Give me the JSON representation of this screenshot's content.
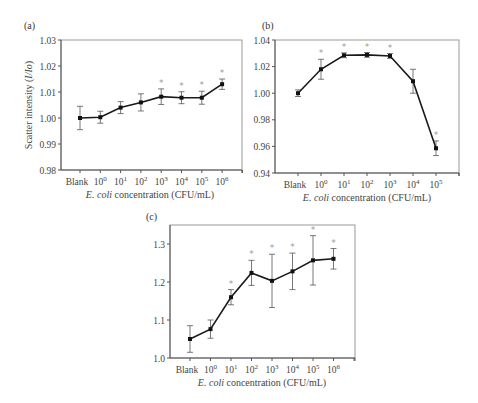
{
  "chart_data": [
    {
      "panel": "(a)",
      "type": "line",
      "title": "",
      "xlabel": "E. coli concentration (CFU/mL)",
      "xlabel_italic": "E. coli",
      "xlabel_rest": " concentration (CFU/mL)",
      "ylabel": "Scatter intensity (I/Io)",
      "categories": [
        "Blank",
        "10^0",
        "10^1",
        "10^2",
        "10^3",
        "10^4",
        "10^5",
        "10^6"
      ],
      "values": [
        1.0,
        1.0003,
        1.004,
        1.006,
        1.0082,
        1.0078,
        1.0078,
        1.013
      ],
      "errors": [
        0.0045,
        0.0023,
        0.0023,
        0.0033,
        0.003,
        0.0023,
        0.0025,
        0.002
      ],
      "significant": [
        false,
        false,
        false,
        false,
        true,
        true,
        true,
        true
      ],
      "ylim": [
        0.98,
        1.03
      ],
      "yticks": [
        0.98,
        0.99,
        1.0,
        1.01,
        1.02,
        1.03
      ],
      "ytick_labels": [
        "0.98",
        "0.99",
        "1.00",
        "1.01",
        "1.02",
        "1.03"
      ],
      "grid": false
    },
    {
      "panel": "(b)",
      "type": "line",
      "title": "",
      "xlabel": "E. coli concentration (CFU/mL)",
      "xlabel_italic": "E. coli",
      "xlabel_rest": " concentration (CFU/mL)",
      "ylabel": "",
      "categories": [
        "Blank",
        "10^0",
        "10^1",
        "10^2",
        "10^3",
        "10^4",
        "10^5"
      ],
      "values": [
        1.0,
        1.018,
        1.0285,
        1.0288,
        1.028,
        1.009,
        0.9586
      ],
      "errors": [
        0.0025,
        0.0075,
        0.0018,
        0.0018,
        0.0018,
        0.009,
        0.0055
      ],
      "significant": [
        false,
        true,
        true,
        true,
        true,
        false,
        true
      ],
      "ylim": [
        0.94,
        1.04
      ],
      "yticks": [
        0.94,
        0.96,
        0.98,
        1.0,
        1.02,
        1.04
      ],
      "ytick_labels": [
        "0.94",
        "0.96",
        "0.98",
        "1.00",
        "1.02",
        "1.04"
      ],
      "grid": false
    },
    {
      "panel": "(c)",
      "type": "line",
      "title": "",
      "xlabel": "E. coli concentration (CFU/mL)",
      "xlabel_italic": "E. coli",
      "xlabel_rest": " concentration (CFU/mL)",
      "ylabel": "",
      "categories": [
        "Blank",
        "10^0",
        "10^1",
        "10^2",
        "10^3",
        "10^4",
        "10^5",
        "10^6"
      ],
      "values": [
        1.05,
        1.076,
        1.16,
        1.224,
        1.203,
        1.228,
        1.257,
        1.261
      ],
      "errors": [
        0.035,
        0.024,
        0.02,
        0.033,
        0.07,
        0.048,
        0.065,
        0.027
      ],
      "significant": [
        false,
        false,
        true,
        true,
        true,
        true,
        true,
        true
      ],
      "ylim": [
        1.0,
        1.35
      ],
      "yticks": [
        1.0,
        1.1,
        1.2,
        1.3
      ],
      "ytick_labels": [
        "1.0",
        "1.1",
        "1.2",
        "1.3"
      ],
      "grid": false
    }
  ],
  "panels": [
    {
      "label": "(a)"
    },
    {
      "label": "(b)"
    },
    {
      "label": "(c)"
    }
  ]
}
